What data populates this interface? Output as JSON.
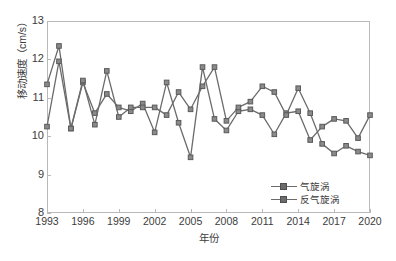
{
  "chart_data": {
    "type": "line",
    "title": "",
    "xlabel": "年份",
    "ylabel": "移动速度（cm/s）",
    "xlim": [
      1993,
      2020
    ],
    "ylim": [
      8,
      13
    ],
    "grid": false,
    "legend_position": "bottom-right",
    "xticks": [
      "1993",
      "1996",
      "1999",
      "2002",
      "2005",
      "2008",
      "2011",
      "2014",
      "2017",
      "2020"
    ],
    "xtick_values": [
      1993,
      1996,
      1999,
      2002,
      2005,
      2008,
      2011,
      2014,
      2017,
      2020
    ],
    "yticks": [
      "8",
      "9",
      "10",
      "11",
      "12",
      "13"
    ],
    "ytick_values": [
      8,
      9,
      10,
      11,
      12,
      13
    ],
    "x": [
      1993,
      1994,
      1995,
      1996,
      1997,
      1998,
      1999,
      2000,
      2001,
      2002,
      2003,
      2004,
      2005,
      2006,
      2007,
      2008,
      2009,
      2010,
      2011,
      2012,
      2013,
      2014,
      2015,
      2016,
      2017,
      2018,
      2019,
      2020
    ],
    "series": [
      {
        "name": "气旋涡",
        "color": "#6b6b6b",
        "marker": "square",
        "values": [
          10.25,
          11.95,
          10.2,
          11.4,
          10.6,
          11.1,
          10.75,
          10.65,
          10.85,
          10.1,
          11.4,
          10.35,
          9.45,
          11.8,
          10.45,
          10.15,
          10.65,
          10.7,
          10.55,
          10.05,
          10.6,
          10.65,
          9.9,
          10.25,
          10.45,
          10.4,
          9.95,
          10.55
        ]
      },
      {
        "name": "反气旋涡",
        "color": "#6b6b6b",
        "marker": "square",
        "values": [
          11.35,
          12.35,
          10.2,
          11.45,
          10.3,
          11.7,
          10.5,
          10.75,
          10.75,
          10.75,
          10.55,
          11.15,
          10.7,
          11.3,
          11.8,
          10.4,
          10.75,
          10.9,
          11.3,
          11.15,
          10.55,
          11.25,
          10.6,
          9.8,
          9.55,
          9.75,
          9.6,
          9.5
        ]
      }
    ]
  }
}
